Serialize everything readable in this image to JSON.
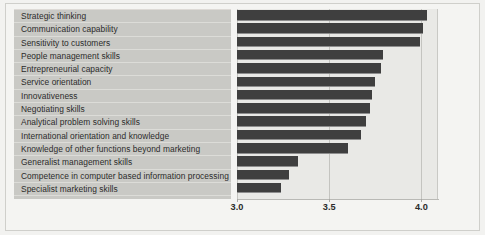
{
  "chart_data": {
    "type": "bar",
    "orientation": "horizontal",
    "title": "",
    "subtitle": "",
    "xlabel": "",
    "ylabel": "",
    "categories": [
      "Strategic thinking",
      "Communication capability",
      "Sensitivity to customers",
      "People management skills",
      "Entrepreneurial capacity",
      "Service orientation",
      "Innovativeness",
      "Negotiating skills",
      "Analytical problem solving skills",
      "International orientation and knowledge",
      "Knowledge of other functions beyond marketing",
      "Generalist management skills",
      "Competence in computer based information processing",
      "Specialist marketing skills"
    ],
    "values": [
      4.03,
      4.01,
      3.99,
      3.79,
      3.78,
      3.75,
      3.73,
      3.72,
      3.7,
      3.67,
      3.6,
      3.33,
      3.28,
      3.24
    ],
    "xlim": [
      3.0,
      4.09
    ],
    "xticks": [
      3.0,
      3.5,
      4.0
    ],
    "xtick_labels": [
      "3.0",
      "3.5",
      "4.0"
    ],
    "gridlines": [
      3.0,
      3.5,
      4.0
    ],
    "grid": true,
    "legend": false,
    "legend_position": "none",
    "bar_color": "#3f3f3f",
    "plot_background": "#e9e9e6",
    "label_background": "#c9c9c5",
    "figure_background": "#f4f4f2"
  }
}
